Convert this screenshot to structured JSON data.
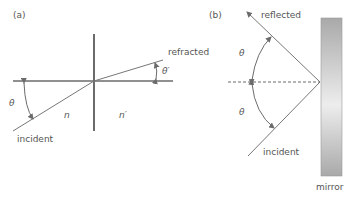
{
  "panel_a": {
    "label": "(a)",
    "refracted_label": "refracted",
    "incident_label": "incident",
    "theta": "θ",
    "theta_prime": "θ′",
    "n": "n",
    "n_prime": "n′"
  },
  "panel_b": {
    "label": "(b)",
    "reflected_label": "reflected",
    "incident_label": "incident",
    "theta_top": "θ",
    "theta_bottom": "θ",
    "mirror_label": "mirror"
  },
  "colors": {
    "line": "#6b6b6b",
    "text": "#555555",
    "mirror_dark": "#a8a8a8",
    "mirror_light": "#ececec"
  }
}
